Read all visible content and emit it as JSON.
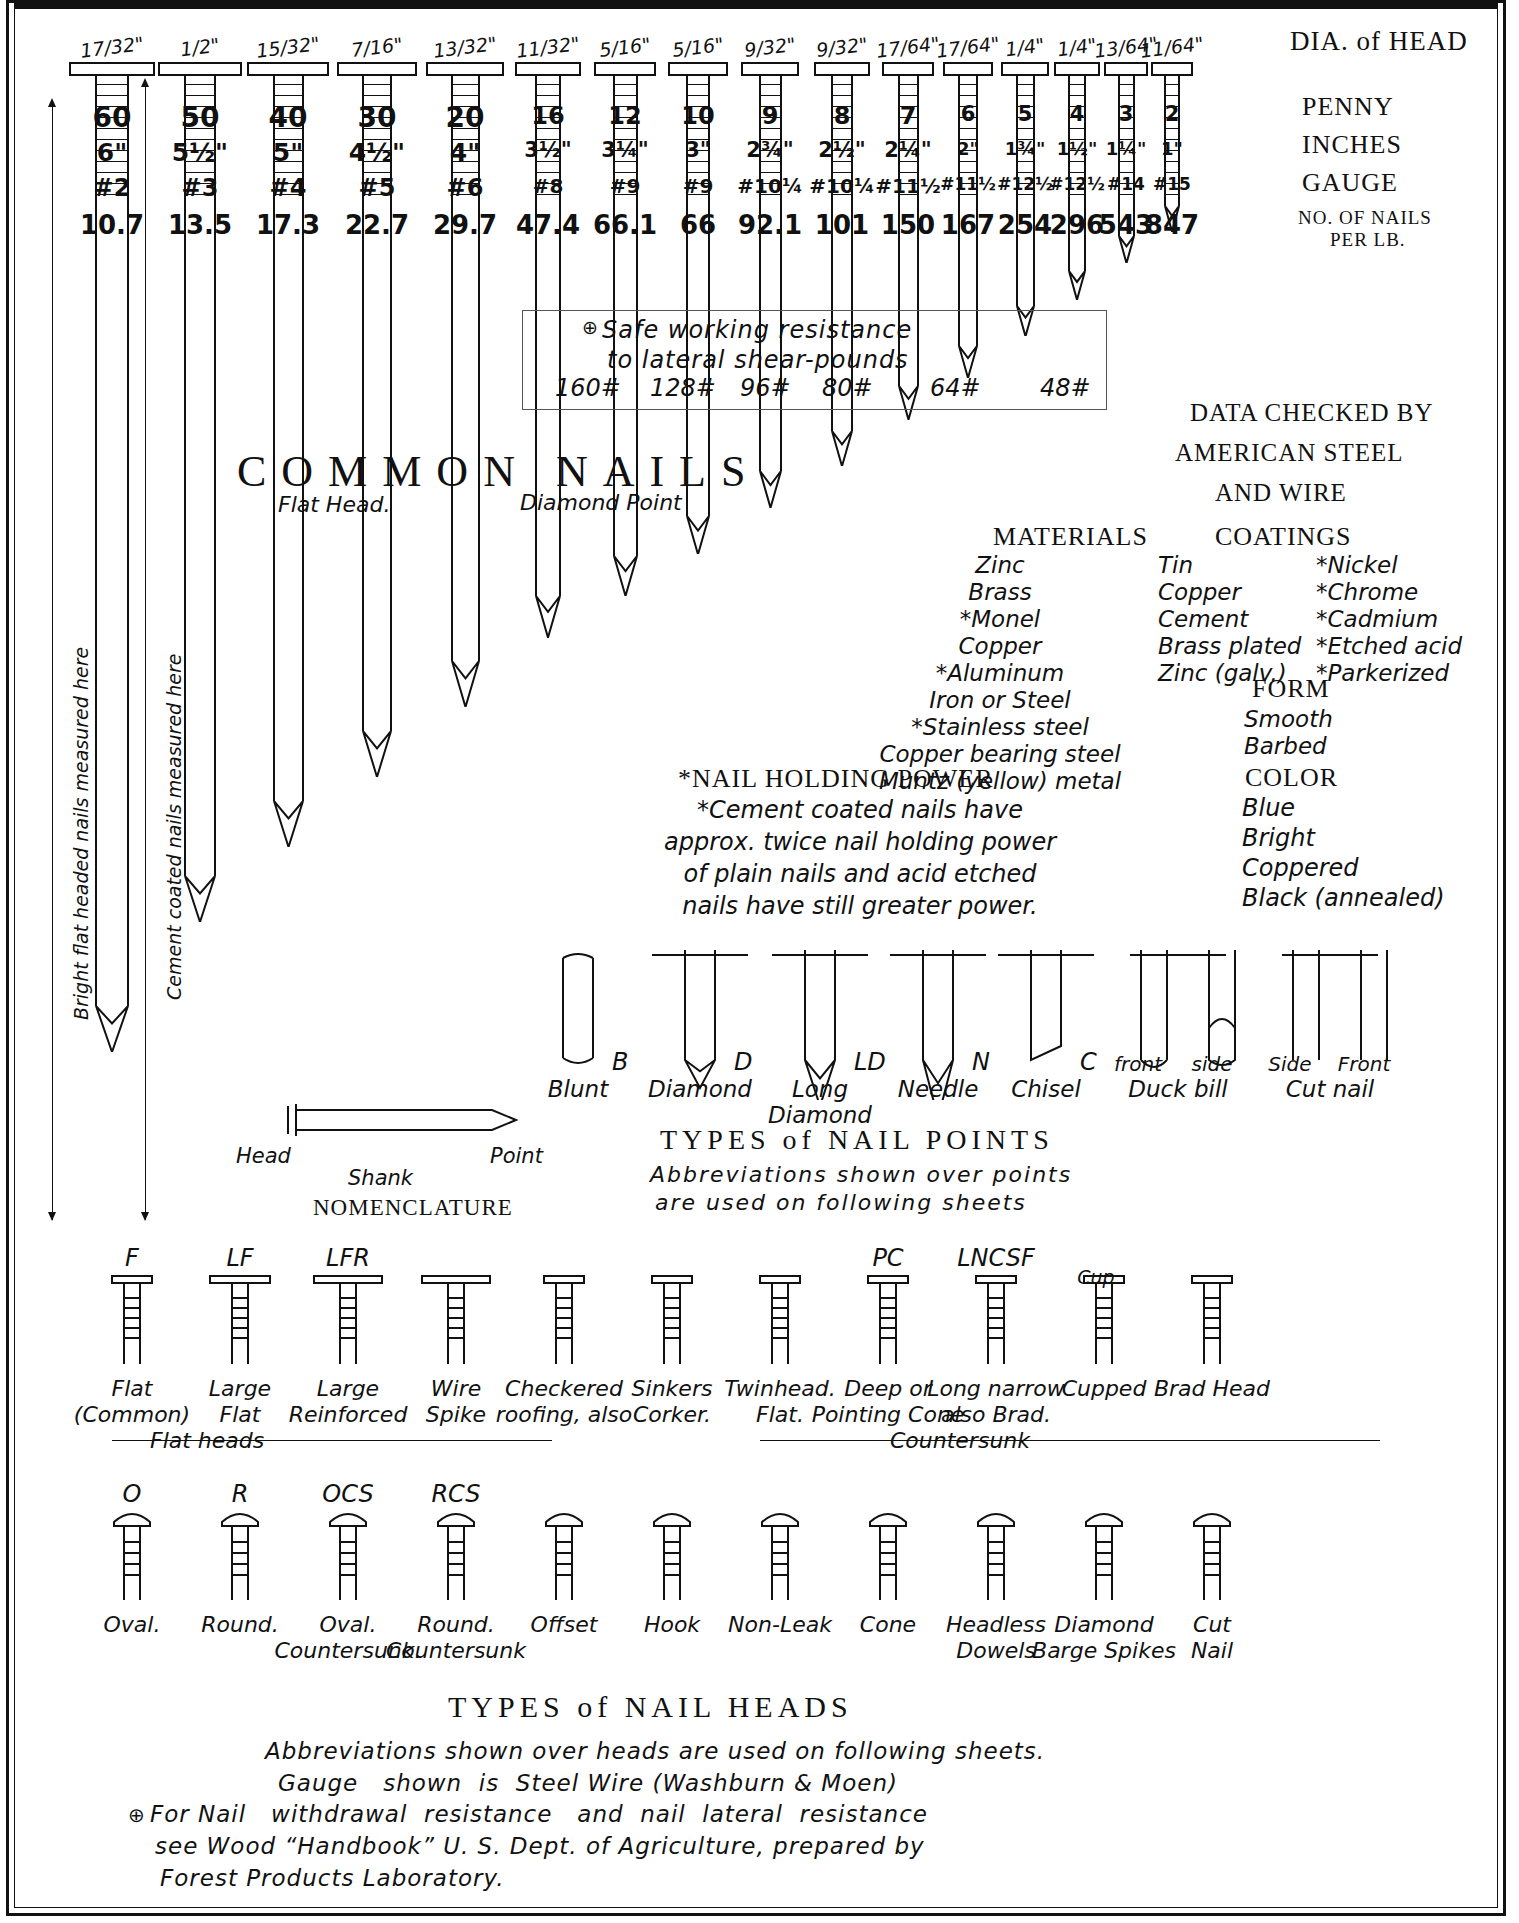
{
  "sheet": {
    "title": "COMMON NAILS",
    "subtitle_left": "Flat Head.",
    "subtitle_right": "Diamond Point",
    "row_labels": {
      "dia_of_head": "DIA. of HEAD",
      "penny": "PENNY",
      "inches": "INCHES",
      "gauge": "GAUGE",
      "per_lb": "NO. OF NAILS\nPER LB."
    },
    "left_dim_labels": [
      "Bright flat headed nails measured here",
      "Cement coated nails measured here"
    ],
    "data_checked_by": [
      "DATA CHECKED BY",
      "AMERICAN STEEL",
      "AND WIRE"
    ]
  },
  "chart_data": {
    "type": "table",
    "title": "COMMON NAILS",
    "columns": [
      "Dia. of head",
      "Penny",
      "Inches",
      "Gauge",
      "No. of nails per lb."
    ],
    "rows": [
      {
        "dia": "17/32\"",
        "penny": "60",
        "inches": "6\"",
        "gauge": "#2",
        "per_lb": "10.7",
        "len_px": 930
      },
      {
        "dia": "1/2\"",
        "penny": "50",
        "inches": "5½\"",
        "gauge": "#3",
        "per_lb": "13.5",
        "len_px": 800
      },
      {
        "dia": "15/32\"",
        "penny": "40",
        "inches": "5\"",
        "gauge": "#4",
        "per_lb": "17.3",
        "len_px": 725
      },
      {
        "dia": "7/16\"",
        "penny": "30",
        "inches": "4½\"",
        "gauge": "#5",
        "per_lb": "22.7",
        "len_px": 655
      },
      {
        "dia": "13/32\"",
        "penny": "20",
        "inches": "4\"",
        "gauge": "#6",
        "per_lb": "29.7",
        "len_px": 585
      },
      {
        "dia": "11/32\"",
        "penny": "16",
        "inches": "3½\"",
        "gauge": "#8",
        "per_lb": "47.4",
        "len_px": 520
      },
      {
        "dia": "5/16\"",
        "penny": "12",
        "inches": "3¼\"",
        "gauge": "#9",
        "per_lb": "66.1",
        "len_px": 480
      },
      {
        "dia": "5/16\"",
        "penny": "10",
        "inches": "3\"",
        "gauge": "#9",
        "per_lb": "66",
        "len_px": 440
      },
      {
        "dia": "9/32\"",
        "penny": "9",
        "inches": "2¾\"",
        "gauge": "#10¼",
        "per_lb": "92.1",
        "len_px": 395
      },
      {
        "dia": "9/32\"",
        "penny": "8",
        "inches": "2½\"",
        "gauge": "#10¼",
        "per_lb": "101",
        "len_px": 355
      },
      {
        "dia": "17/64\"",
        "penny": "7",
        "inches": "2¼\"",
        "gauge": "#11½",
        "per_lb": "150",
        "len_px": 310
      },
      {
        "dia": "17/64\"",
        "penny": "6",
        "inches": "2\"",
        "gauge": "#11½",
        "per_lb": "167",
        "len_px": 270
      },
      {
        "dia": "1/4\"",
        "penny": "5",
        "inches": "1¾\"",
        "gauge": "#12½",
        "per_lb": "254",
        "len_px": 230
      },
      {
        "dia": "1/4\"",
        "penny": "4",
        "inches": "1½\"",
        "gauge": "#12½",
        "per_lb": "296",
        "len_px": 195
      },
      {
        "dia": "13/64\"",
        "penny": "3",
        "inches": "1¼\"",
        "gauge": "#14",
        "per_lb": "543",
        "len_px": 160
      },
      {
        "dia": "11/64\"",
        "penny": "2",
        "inches": "1\"",
        "gauge": "#15",
        "per_lb": "847",
        "len_px": 130
      }
    ],
    "shear": {
      "heading_line1": "Safe working resistance",
      "heading_line2": "to lateral shear-pounds",
      "marker": "⊕",
      "values": [
        "160#",
        "128#",
        "96#",
        "80#",
        "64#",
        "48#"
      ]
    }
  },
  "materials": {
    "heading": "MATERIALS",
    "items": [
      "Zinc",
      "Brass",
      "*Monel",
      "Copper",
      "*Aluminum",
      "Iron or Steel",
      "*Stainless steel",
      "Copper bearing steel",
      "Muntz (yellow) metal"
    ]
  },
  "coatings": {
    "heading": "COATINGS",
    "left": [
      "Tin",
      "Copper",
      "Cement",
      "Brass plated",
      "Zinc (galv.)"
    ],
    "right": [
      "*Nickel",
      "*Chrome",
      "*Cadmium",
      "*Etched acid",
      "*Parkerized"
    ]
  },
  "form": {
    "heading": "FORM",
    "items": [
      "Smooth",
      "Barbed"
    ]
  },
  "color": {
    "heading": "COLOR",
    "items": [
      "Blue",
      "Bright",
      "Coppered",
      "Black (annealed)"
    ]
  },
  "holding_power": {
    "heading": "*NAIL HOLDING POWER",
    "lines": [
      "*Cement coated nails have",
      "approx. twice nail holding power",
      "of plain nails and acid etched",
      "nails have still greater power."
    ]
  },
  "nail_points": {
    "heading": "TYPES of NAIL POINTS",
    "note_line1": "Abbreviations shown over points",
    "note_line2": "are used on following sheets",
    "items": [
      {
        "abbr": "B",
        "label": "Blunt",
        "kind": "blunt"
      },
      {
        "abbr": "D",
        "label": "Diamond",
        "kind": "diamond"
      },
      {
        "abbr": "LD",
        "label": "Long\nDiamond",
        "kind": "longdiamond"
      },
      {
        "abbr": "N",
        "label": "Needle",
        "kind": "needle"
      },
      {
        "abbr": "C",
        "label": "Chisel",
        "kind": "chisel"
      },
      {
        "abbr": "",
        "label": "Duck bill",
        "sublabels": [
          "front",
          "side"
        ],
        "kind": "duckbill"
      },
      {
        "abbr": "",
        "label": "Cut nail",
        "sublabels": [
          "Side",
          "Front"
        ],
        "kind": "cutnail"
      }
    ]
  },
  "nomenclature": {
    "heading": "NOMENCLATURE",
    "head": "Head",
    "shank": "Shank",
    "point": "Point"
  },
  "nail_heads": {
    "heading": "TYPES of NAIL HEADS",
    "row1": [
      {
        "abbr": "F",
        "label": "Flat\n(Common)"
      },
      {
        "abbr": "LF",
        "label": "Large\nFlat"
      },
      {
        "abbr": "LFR",
        "label": "Large\nReinforced"
      },
      {
        "abbr": "",
        "label": "Wire\nSpike"
      },
      {
        "abbr": "",
        "label": "Checkered\nroofing, also"
      },
      {
        "abbr": "",
        "label": "Sinkers\nCorker."
      },
      {
        "abbr": "",
        "label": "Twinhead.\nFlat."
      },
      {
        "abbr": "PC",
        "label": "Deep or\nPointing Cone"
      },
      {
        "abbr": "LNCSF",
        "label": "Long narrow\nalso Brad."
      },
      {
        "abbr": "",
        "label": "Cupped",
        "extra": "Cup"
      },
      {
        "abbr": "",
        "label": "Brad Head"
      }
    ],
    "row1_group_left": "Flat heads",
    "row1_group_right": "Countersunk",
    "row2": [
      {
        "abbr": "O",
        "label": "Oval."
      },
      {
        "abbr": "R",
        "label": "Round."
      },
      {
        "abbr": "OCS",
        "label": "Oval.\nCountersunk."
      },
      {
        "abbr": "RCS",
        "label": "Round.\nCountersunk"
      },
      {
        "abbr": "",
        "label": "Offset"
      },
      {
        "abbr": "",
        "label": "Hook"
      },
      {
        "abbr": "",
        "label": "Non-Leak"
      },
      {
        "abbr": "",
        "label": "Cone"
      },
      {
        "abbr": "",
        "label": "Headless\nDowels"
      },
      {
        "abbr": "",
        "label": "Diamond\nBarge Spikes"
      },
      {
        "abbr": "",
        "label": "Cut\nNail"
      }
    ]
  },
  "footer": {
    "line1": "Abbreviations shown over heads are used on following sheets.",
    "line2": "Gauge   shown  is  Steel Wire (Washburn & Moen)",
    "line3": "For Nail   withdrawal  resistance   and  nail  lateral  resistance",
    "line4": "see Wood “Handbook” U. S. Dept. of Agriculture, prepared by",
    "line5": "Forest Products Laboratory.",
    "marker": "⊕"
  }
}
